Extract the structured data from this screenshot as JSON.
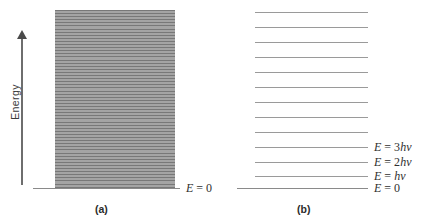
{
  "figure": {
    "type": "energy-level-diagram",
    "axis": {
      "label": "Energy",
      "direction": "up",
      "icon": "up-arrow-icon"
    },
    "panels": [
      {
        "id": "a",
        "caption": "(a)",
        "description": "classical continuum of energies",
        "baseline_label": "E = 0",
        "continuum": {
          "line_count": 57,
          "top_y": 10,
          "bottom_y": 188,
          "fill_color": "#8e8e8e",
          "line_color": "#787878"
        }
      },
      {
        "id": "b",
        "caption": "(b)",
        "description": "quantized discrete energy levels",
        "levels": [
          {
            "index": 12,
            "y": 12,
            "label": ""
          },
          {
            "index": 11,
            "y": 27,
            "label": ""
          },
          {
            "index": 10,
            "y": 42,
            "label": ""
          },
          {
            "index": 9,
            "y": 57,
            "label": ""
          },
          {
            "index": 8,
            "y": 72,
            "label": ""
          },
          {
            "index": 7,
            "y": 87,
            "label": ""
          },
          {
            "index": 6,
            "y": 102,
            "label": ""
          },
          {
            "index": 5,
            "y": 117,
            "label": ""
          },
          {
            "index": 4,
            "y": 132,
            "label": ""
          },
          {
            "index": 3,
            "y": 147,
            "label": "E = 3hν"
          },
          {
            "index": 2,
            "y": 162,
            "label": "E = 2hν"
          },
          {
            "index": 1,
            "y": 176,
            "label": "E = hν"
          }
        ],
        "baseline_label": "E = 0"
      }
    ],
    "colors": {
      "line": "#9a9a9a",
      "baseline": "#8a8a8a",
      "block_fill": "#8e8e8e",
      "text": "#2f2f2f",
      "background": "#ffffff"
    }
  }
}
